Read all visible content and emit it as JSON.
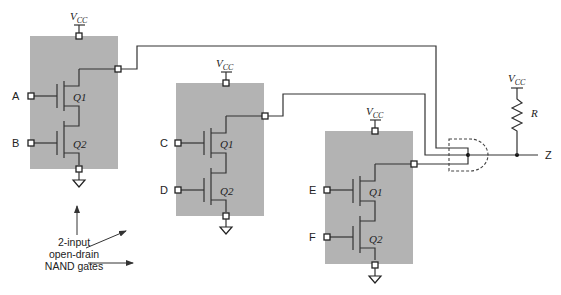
{
  "diagram": {
    "supply_label": "V",
    "supply_subscript": "CC",
    "gates": [
      {
        "id": "gate1",
        "inputs": [
          "A",
          "B"
        ],
        "transistors": [
          "Q1",
          "Q2"
        ]
      },
      {
        "id": "gate2",
        "inputs": [
          "C",
          "D"
        ],
        "transistors": [
          "Q1",
          "Q2"
        ]
      },
      {
        "id": "gate3",
        "inputs": [
          "E",
          "F"
        ],
        "transistors": [
          "Q1",
          "Q2"
        ]
      }
    ],
    "pullup_resistor_label": "R",
    "output_label": "Z",
    "caption": {
      "line1": "2-input",
      "line2": "open-drain",
      "line3": "NAND gates"
    },
    "colors": {
      "gate_box": "#b3b3b3",
      "wire": "#333333",
      "background": "#ffffff"
    }
  }
}
